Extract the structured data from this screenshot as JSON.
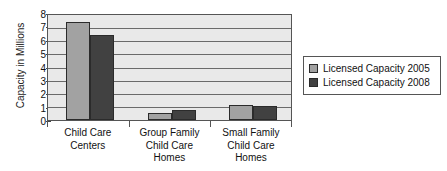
{
  "chart_data": {
    "type": "bar",
    "title": "",
    "xlabel": "",
    "ylabel": "Capacity in Millions",
    "ylim": [
      0,
      8
    ],
    "yticks": [
      0,
      1,
      2,
      3,
      4,
      5,
      6,
      7,
      8
    ],
    "ytick_labels": [
      "0",
      "1",
      "2",
      "3",
      "4",
      "5",
      "6",
      "7",
      "8"
    ],
    "grid": true,
    "legend_position": "right",
    "categories": [
      "Child Care Centers",
      "Group Family Child Care Homes",
      "Small Family Child Care Homes"
    ],
    "category_lines": [
      [
        "Child Care",
        "Centers"
      ],
      [
        "Group Family",
        "Child Care",
        "Homes"
      ],
      [
        "Small Family",
        "Child Care",
        "Homes"
      ]
    ],
    "series": [
      {
        "name": "Licensed Capacity 2005",
        "color": "#a2a2a2",
        "values": [
          7.5,
          0.5,
          1.15
        ]
      },
      {
        "name": "Licensed Capacity 2008",
        "color": "#414141",
        "values": [
          6.5,
          0.75,
          1.1
        ]
      }
    ]
  },
  "legend": {
    "items": [
      {
        "label": "Licensed Capacity 2005",
        "color": "#a2a2a2"
      },
      {
        "label": "Licensed Capacity 2008",
        "color": "#414141"
      }
    ]
  },
  "axis": {
    "y_title": "Capacity in Millions",
    "y_tick_0": "0",
    "y_tick_1": "1",
    "y_tick_2": "2",
    "y_tick_3": "3",
    "y_tick_4": "4",
    "y_tick_5": "5",
    "y_tick_6": "6",
    "y_tick_7": "7",
    "y_tick_8": "8"
  },
  "x_labels": {
    "g0_l0": "Child Care",
    "g0_l1": "Centers",
    "g1_l0": "Group Family",
    "g1_l1": "Child Care",
    "g1_l2": "Homes",
    "g2_l0": "Small Family",
    "g2_l1": "Child Care",
    "g2_l2": "Homes"
  },
  "colors": {
    "series_2005": "#a2a2a2",
    "series_2008": "#414141",
    "plot_background": "#e9e9e9",
    "axis_line": "#555555",
    "gridline": "#6a6a6a"
  }
}
